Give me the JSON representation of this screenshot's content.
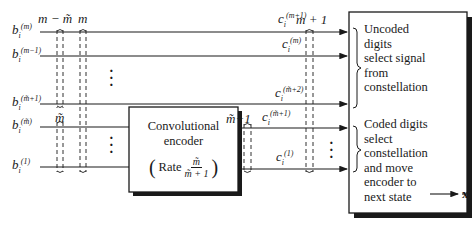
{
  "diagram": {
    "inputs": [
      {
        "id": "b_m",
        "base": "b",
        "sub": "i",
        "sup": "(m)"
      },
      {
        "id": "b_m_minus_1",
        "base": "b",
        "sub": "i",
        "sup": "(m−1)"
      },
      {
        "id": "b_mt_plus_1",
        "base": "b",
        "sub": "i",
        "sup": "(m̃+1)"
      },
      {
        "id": "b_mt",
        "base": "b",
        "sub": "i",
        "sup": "(m̃)"
      },
      {
        "id": "b_1",
        "base": "b",
        "sub": "i",
        "sup": "(1)"
      }
    ],
    "group_labels": {
      "m_minus_mt": "m − m̃",
      "m": "m",
      "mt": "m̃",
      "mt_plus_1": "m̃+1",
      "m_plus_1": "m + 1"
    },
    "outputs": [
      {
        "id": "c_m_plus_1",
        "base": "c",
        "sub": "i",
        "sup": "(m+1)"
      },
      {
        "id": "c_m",
        "base": "c",
        "sub": "i",
        "sup": "(m)"
      },
      {
        "id": "c_mt_plus_2",
        "base": "c",
        "sub": "i",
        "sup": "(m̃+2)"
      },
      {
        "id": "c_mt_plus_1",
        "base": "c",
        "sub": "i",
        "sup": "(m̃+1)"
      },
      {
        "id": "c_1",
        "base": "c",
        "sub": "i",
        "sup": "(1)"
      }
    ],
    "encoder": {
      "line1": "Convolutional",
      "line2": "encoder",
      "rate_word": "Rate",
      "rate_num": "m̃",
      "rate_den": "m̃ + 1"
    },
    "mapper": {
      "uncoded": [
        "Uncoded",
        "digits",
        "select signal",
        "from",
        "constellation"
      ],
      "coded": [
        "Coded digits",
        "select",
        "constellation",
        "and move",
        "encoder to",
        "next state"
      ]
    },
    "output_signal": {
      "base": "x",
      "sub": "i"
    }
  }
}
